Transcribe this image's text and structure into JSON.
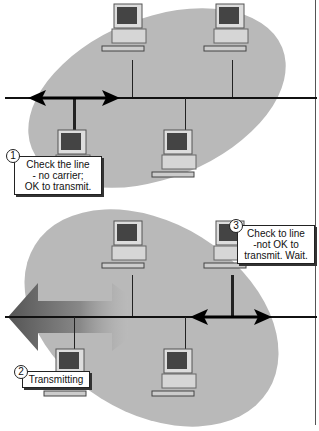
{
  "diagram": {
    "colors": {
      "collision_domain": "#b9b9b9",
      "bus_line": "#111111",
      "callout_bg": "#ffffff"
    },
    "panels": [
      {
        "id": "panel-1",
        "hosts": 4,
        "signal": "bidirectional-arrow-small",
        "callouts": [
          {
            "number": "1",
            "lines": [
              "Check the line",
              "- no carrier;",
              "OK to transmit."
            ]
          }
        ]
      },
      {
        "id": "panel-2",
        "hosts": 4,
        "signal": "large-transmission-arrow",
        "callouts": [
          {
            "number": "2",
            "lines": [
              "Transmitting"
            ]
          },
          {
            "number": "3",
            "lines": [
              "Check to line",
              "-not OK to",
              "transmit.  Wait."
            ]
          }
        ]
      }
    ]
  }
}
